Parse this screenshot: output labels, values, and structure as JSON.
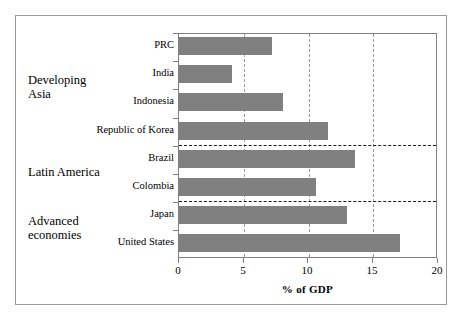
{
  "chart_data": {
    "type": "bar",
    "orientation": "horizontal",
    "title": "",
    "xlabel": "% of GDP",
    "ylabel": "",
    "xlim": [
      0,
      20
    ],
    "xticks": [
      0,
      5,
      10,
      15,
      20
    ],
    "xtick_labels": [
      "0",
      "5",
      "10",
      "15",
      "20"
    ],
    "grid": "vertical-dashed",
    "legend": "none",
    "bar_color": "#808080",
    "categories": [
      "PRC",
      "India",
      "Indonesia",
      "Republic of Korea",
      "Brazil",
      "Colombia",
      "Japan",
      "United States"
    ],
    "values": [
      7.2,
      4.1,
      8.0,
      11.5,
      13.6,
      10.6,
      13.0,
      17.1
    ],
    "groups": [
      {
        "label": "Developing\nAsia",
        "categories": [
          "PRC",
          "India",
          "Indonesia",
          "Republic of Korea"
        ]
      },
      {
        "label": "Latin America",
        "categories": [
          "Brazil",
          "Colombia"
        ]
      },
      {
        "label": "Advanced\neconomies",
        "categories": [
          "Japan",
          "United States"
        ]
      }
    ],
    "group_separators_after": [
      "Republic of Korea",
      "Colombia"
    ]
  },
  "axis": {
    "x_title": "% of GDP",
    "ticks": [
      "0",
      "5",
      "10",
      "15",
      "20"
    ]
  },
  "categories": {
    "c0": "PRC",
    "c1": "India",
    "c2": "Indonesia",
    "c3": "Republic of Korea",
    "c4": "Brazil",
    "c5": "Colombia",
    "c6": "Japan",
    "c7": "United States"
  },
  "groups": {
    "g0": "Developing\nAsia",
    "g1": "Latin America",
    "g2": "Advanced\neconomies"
  }
}
